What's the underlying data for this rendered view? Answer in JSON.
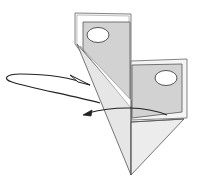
{
  "diagram": {
    "type": "origami-fold-step",
    "colors": {
      "background": "#ffffff",
      "paper_light": "#e9e9e9",
      "paper_mid": "#d2d2d2",
      "outline": "#555555",
      "arrow": "#222222",
      "hole": "#ffffff"
    },
    "elements": {
      "left_flap": {
        "hole": "oval"
      },
      "right_flap": {
        "hole": "oval"
      },
      "point": "triangular tip",
      "arrows": [
        {
          "name": "loop-arrow",
          "direction": "fold behind (loop to left and back)"
        },
        {
          "name": "curved-arrow",
          "direction": "right to left"
        }
      ]
    }
  }
}
